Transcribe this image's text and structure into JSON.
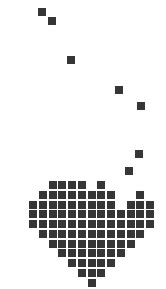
{
  "artwork": {
    "subject": "pixel heart with trailing dots",
    "pixel_color": "#363636",
    "background_color": "#ffffff",
    "pixel_size": 8,
    "floating_dots": [
      {
        "x": 38,
        "y": 8
      },
      {
        "x": 48,
        "y": 17
      },
      {
        "x": 67,
        "y": 56
      },
      {
        "x": 115,
        "y": 86
      },
      {
        "x": 137,
        "y": 102
      },
      {
        "x": 135,
        "y": 150
      },
      {
        "x": 125,
        "y": 167
      }
    ],
    "heart": {
      "origin_x": 29,
      "origin_y": 181,
      "pitch": 9.75,
      "rows": [
        [
          2,
          3,
          4,
          5,
          7
        ],
        [
          1,
          2,
          3,
          4,
          5,
          6,
          7,
          8,
          11
        ],
        [
          0,
          1,
          2,
          3,
          4,
          5,
          6,
          7,
          8,
          10,
          11,
          12
        ],
        [
          0,
          1,
          2,
          3,
          4,
          5,
          6,
          7,
          8,
          9,
          10,
          11,
          12
        ],
        [
          0,
          1,
          2,
          3,
          4,
          5,
          6,
          7,
          8,
          9,
          10,
          11,
          12
        ],
        [
          1,
          2,
          3,
          4,
          5,
          6,
          7,
          8,
          9,
          10,
          11
        ],
        [
          2,
          3,
          4,
          5,
          6,
          7,
          8,
          9,
          10
        ],
        [
          3,
          4,
          5,
          6,
          7,
          8,
          9
        ],
        [
          4,
          5,
          6,
          7,
          8
        ],
        [
          5,
          6,
          7
        ],
        [
          6
        ]
      ]
    }
  }
}
